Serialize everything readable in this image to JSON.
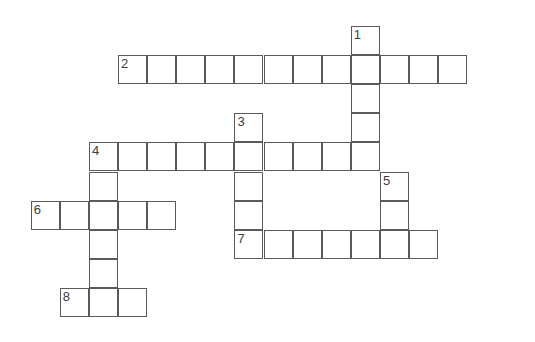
{
  "puzzle": {
    "title": "Crossword Puzzle Grid",
    "grid_geometry": {
      "cell_size": 29.1,
      "origin_x": 1.6,
      "origin_y": 26.0,
      "line_color": "#5a5a5a",
      "cell_fill": "#ffffff",
      "number_color": "#3d3d3d",
      "background": "#ffffff",
      "canvas_width": 535,
      "canvas_height": 342
    },
    "entries": [
      {
        "number": "1",
        "direction": "down",
        "start_col": 12,
        "start_row": 0,
        "length": 6,
        "label": "clue-1-down"
      },
      {
        "number": "2",
        "direction": "across",
        "start_col": 4,
        "start_row": 1,
        "length": 12,
        "label": "clue-2-across"
      },
      {
        "number": "3",
        "direction": "down",
        "start_col": 8,
        "start_row": 3,
        "length": 6,
        "label": "clue-3-down"
      },
      {
        "number": "4",
        "direction": "across",
        "start_col": 3,
        "start_row": 4,
        "length": 10,
        "label": "clue-4-across"
      },
      {
        "number": "4",
        "direction": "down",
        "start_col": 3,
        "start_row": 4,
        "length": 6,
        "label": "clue-4-down"
      },
      {
        "number": "5",
        "direction": "down",
        "start_col": 13,
        "start_row": 5,
        "length": 3,
        "label": "clue-5-down"
      },
      {
        "number": "6",
        "direction": "across",
        "start_col": 1,
        "start_row": 6,
        "length": 5,
        "label": "clue-6-across"
      },
      {
        "number": "7",
        "direction": "across",
        "start_col": 8,
        "start_row": 7,
        "length": 7,
        "label": "clue-7-across"
      },
      {
        "number": "8",
        "direction": "across",
        "start_col": 2,
        "start_row": 9,
        "length": 3,
        "label": "clue-8-across"
      }
    ],
    "cells": [
      {
        "col": 12,
        "row": 0,
        "number": "1"
      },
      {
        "col": 4,
        "row": 1,
        "number": "2"
      },
      {
        "col": 5,
        "row": 1,
        "number": ""
      },
      {
        "col": 6,
        "row": 1,
        "number": ""
      },
      {
        "col": 7,
        "row": 1,
        "number": ""
      },
      {
        "col": 8,
        "row": 1,
        "number": ""
      },
      {
        "col": 9,
        "row": 1,
        "number": ""
      },
      {
        "col": 10,
        "row": 1,
        "number": ""
      },
      {
        "col": 11,
        "row": 1,
        "number": ""
      },
      {
        "col": 12,
        "row": 1,
        "number": ""
      },
      {
        "col": 13,
        "row": 1,
        "number": ""
      },
      {
        "col": 14,
        "row": 1,
        "number": ""
      },
      {
        "col": 15,
        "row": 1,
        "number": ""
      },
      {
        "col": 12,
        "row": 2,
        "number": ""
      },
      {
        "col": 12,
        "row": 3,
        "number": ""
      },
      {
        "col": 8,
        "row": 3,
        "number": "3"
      },
      {
        "col": 3,
        "row": 4,
        "number": "4"
      },
      {
        "col": 4,
        "row": 4,
        "number": ""
      },
      {
        "col": 5,
        "row": 4,
        "number": ""
      },
      {
        "col": 6,
        "row": 4,
        "number": ""
      },
      {
        "col": 7,
        "row": 4,
        "number": ""
      },
      {
        "col": 8,
        "row": 4,
        "number": ""
      },
      {
        "col": 9,
        "row": 4,
        "number": ""
      },
      {
        "col": 10,
        "row": 4,
        "number": ""
      },
      {
        "col": 11,
        "row": 4,
        "number": ""
      },
      {
        "col": 12,
        "row": 4,
        "number": ""
      },
      {
        "col": 3,
        "row": 5,
        "number": ""
      },
      {
        "col": 8,
        "row": 5,
        "number": ""
      },
      {
        "col": 13,
        "row": 5,
        "number": "5"
      },
      {
        "col": 1,
        "row": 6,
        "number": "6"
      },
      {
        "col": 2,
        "row": 6,
        "number": ""
      },
      {
        "col": 3,
        "row": 6,
        "number": ""
      },
      {
        "col": 4,
        "row": 6,
        "number": ""
      },
      {
        "col": 5,
        "row": 6,
        "number": ""
      },
      {
        "col": 8,
        "row": 6,
        "number": ""
      },
      {
        "col": 13,
        "row": 6,
        "number": ""
      },
      {
        "col": 3,
        "row": 7,
        "number": ""
      },
      {
        "col": 8,
        "row": 7,
        "number": "7"
      },
      {
        "col": 9,
        "row": 7,
        "number": ""
      },
      {
        "col": 10,
        "row": 7,
        "number": ""
      },
      {
        "col": 11,
        "row": 7,
        "number": ""
      },
      {
        "col": 12,
        "row": 7,
        "number": ""
      },
      {
        "col": 13,
        "row": 7,
        "number": ""
      },
      {
        "col": 14,
        "row": 7,
        "number": ""
      },
      {
        "col": 3,
        "row": 8,
        "number": ""
      },
      {
        "col": 2,
        "row": 9,
        "number": "8"
      },
      {
        "col": 3,
        "row": 9,
        "number": ""
      },
      {
        "col": 4,
        "row": 9,
        "number": ""
      }
    ]
  }
}
